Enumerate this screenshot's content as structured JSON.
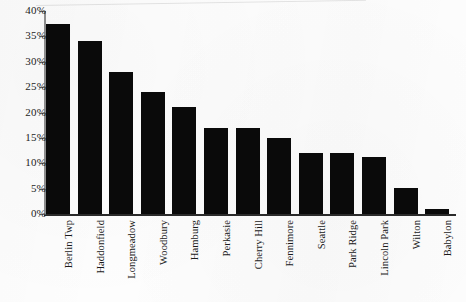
{
  "chart_data": {
    "type": "bar",
    "title": "",
    "subtitle": "",
    "xlabel": "",
    "ylabel": "",
    "categories": [
      "Berlin Twp",
      "Haddonfield",
      "Longmeadow",
      "Woodbury",
      "Hamburg",
      "Perkasie",
      "Cherry Hill",
      "Fennimore",
      "Seattle",
      "Park Ridge",
      "Lincoln Park",
      "Wilton",
      "Babylon"
    ],
    "values": [
      37.5,
      34,
      28,
      24,
      21,
      17,
      17,
      15,
      12,
      12,
      11.3,
      5.2,
      1
    ],
    "value_unit": "%",
    "ylim": [
      0,
      40
    ],
    "ytick_values": [
      0,
      5,
      10,
      15,
      20,
      25,
      30,
      35,
      40
    ],
    "ytick_labels": [
      "0%",
      "5%",
      "10%",
      "15%",
      "20%",
      "25%",
      "30%",
      "35%",
      "40%"
    ],
    "grid": false,
    "legend": null,
    "bar_color": "#0a0a0a",
    "axis_color": "#2a2a2a",
    "background_color": "#fdfdfd",
    "annotations": []
  }
}
